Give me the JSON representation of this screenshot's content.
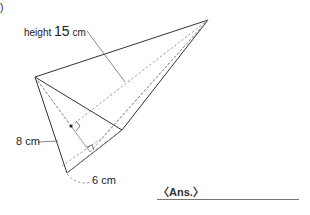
{
  "problem": {
    "number_label": ")",
    "height_label_prefix": "height",
    "height_value": "15",
    "height_unit": "cm",
    "side_label": "8 cm",
    "base_label": "6 cm",
    "answer_label": "〈Ans.〉",
    "answer_value": ""
  },
  "figure": {
    "type": "triangular-pyramid",
    "apex": [
      208,
      20
    ],
    "base_vertices": [
      [
        35,
        77
      ],
      [
        67,
        173
      ],
      [
        122,
        130
      ]
    ],
    "line_color": "#333333",
    "hidden_line_color": "#777777"
  }
}
